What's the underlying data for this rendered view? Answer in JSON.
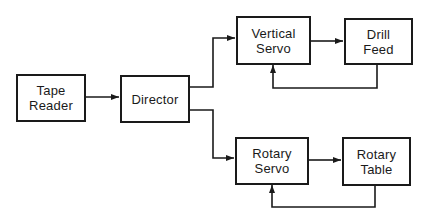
{
  "diagram": {
    "type": "block-diagram",
    "line_color": "#1a1a1a",
    "nodes": {
      "tape_reader": {
        "line1": "Tape",
        "line2": "Reader"
      },
      "director": {
        "line1": "Director"
      },
      "vertical_servo": {
        "line1": "Vertical",
        "line2": "Servo"
      },
      "drill_feed": {
        "line1": "Drill",
        "line2": "Feed"
      },
      "rotary_servo": {
        "line1": "Rotary",
        "line2": "Servo"
      },
      "rotary_table": {
        "line1": "Rotary",
        "line2": "Table"
      }
    },
    "edges": [
      {
        "from": "Tape Reader",
        "to": "Director"
      },
      {
        "from": "Director",
        "to": "Vertical Servo"
      },
      {
        "from": "Director",
        "to": "Rotary Servo"
      },
      {
        "from": "Vertical Servo",
        "to": "Drill Feed"
      },
      {
        "from": "Drill Feed",
        "to": "Vertical Servo",
        "kind": "feedback"
      },
      {
        "from": "Rotary Servo",
        "to": "Rotary Table"
      },
      {
        "from": "Rotary Table",
        "to": "Rotary Servo",
        "kind": "feedback"
      }
    ]
  }
}
